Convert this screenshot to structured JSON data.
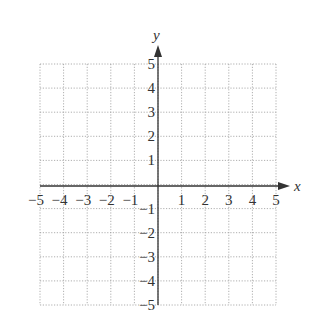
{
  "chart_data": {
    "type": "scatter",
    "title": "",
    "xlabel": "x",
    "ylabel": "y",
    "xlim": [
      -5,
      5
    ],
    "ylim": [
      -5,
      5
    ],
    "grid": true,
    "grid_style": "dotted",
    "x_ticks": [
      -5,
      -4,
      -3,
      -2,
      -1,
      1,
      2,
      3,
      4,
      5
    ],
    "y_ticks": [
      -5,
      -4,
      -3,
      -2,
      -1,
      1,
      2,
      3,
      4,
      5
    ],
    "x_tick_labels": [
      "−5",
      "−4",
      "−3",
      "−2",
      "−1",
      "1",
      "2",
      "3",
      "4",
      "5"
    ],
    "y_tick_labels": [
      "−5",
      "−4",
      "−3",
      "−2",
      "−1",
      "1",
      "2",
      "3",
      "4",
      "5"
    ],
    "series": [],
    "legend": null
  },
  "colors": {
    "axis": "#333333",
    "grid": "#9a9a9a",
    "background": "#ffffff"
  }
}
